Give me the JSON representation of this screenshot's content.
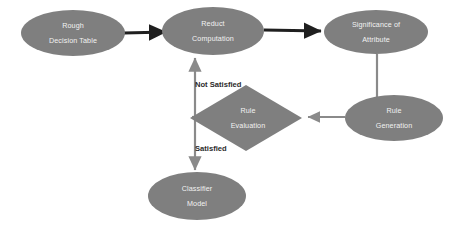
{
  "diagram": {
    "type": "flowchart",
    "background_color": "#ffffff",
    "node_fill_color": "#7f7f7f",
    "node_text_color": "#f2f2f2",
    "thick_edge_color": "#1f1f1f",
    "thin_edge_color": "#808080",
    "label_text_color": "#2b2b2b",
    "nodes": [
      {
        "id": "rough-decision-table",
        "shape": "ellipse",
        "line1": "Rough",
        "line2": "Decision Table",
        "cx": 73,
        "cy": 33,
        "rx": 52,
        "ry": 23
      },
      {
        "id": "reduct-computation",
        "shape": "ellipse",
        "line1": "Reduct",
        "line2": "Computation",
        "cx": 213,
        "cy": 31,
        "rx": 51,
        "ry": 24
      },
      {
        "id": "significance-of-attribute",
        "shape": "ellipse",
        "line1": "Significance of",
        "line2": "Attribute",
        "cx": 376,
        "cy": 32,
        "rx": 52,
        "ry": 22
      },
      {
        "id": "rule-generation",
        "shape": "ellipse",
        "line1": "Rule",
        "line2": "Generation",
        "cx": 394,
        "cy": 118,
        "rx": 49,
        "ry": 23
      },
      {
        "id": "rule-evaluation",
        "shape": "diamond",
        "line1": "Rule",
        "line2": "Evaluation",
        "cx": 246,
        "cy": 118,
        "rx": 56,
        "ry": 33
      },
      {
        "id": "classifier-model",
        "shape": "ellipse",
        "line1": "Classifier",
        "line2": "Model",
        "cx": 197,
        "cy": 196,
        "rx": 49,
        "ry": 24
      }
    ],
    "edge_labels": [
      {
        "id": "not-satisfied",
        "text": "Not Satisfied",
        "x": 195,
        "y": 85
      },
      {
        "id": "satisfied",
        "text": "Satisfied",
        "x": 195,
        "y": 149
      }
    ],
    "edges": [
      {
        "id": "edge-table-to-reduct",
        "from": "rough-decision-table",
        "to": "reduct-computation",
        "style": "thick"
      },
      {
        "id": "edge-reduct-to-significance",
        "from": "reduct-computation",
        "to": "significance-of-attribute",
        "style": "thick"
      },
      {
        "id": "edge-significance-to-generation",
        "from": "significance-of-attribute",
        "to": "rule-generation",
        "style": "thin"
      },
      {
        "id": "edge-generation-to-evaluation",
        "from": "rule-generation",
        "to": "rule-evaluation",
        "style": "thin"
      },
      {
        "id": "edge-evaluation-to-reduct",
        "from": "rule-evaluation",
        "to": "reduct-computation",
        "style": "thin",
        "label": "Not Satisfied"
      },
      {
        "id": "edge-evaluation-to-classifier",
        "from": "rule-evaluation",
        "to": "classifier-model",
        "style": "thin",
        "label": "Satisfied"
      }
    ]
  }
}
